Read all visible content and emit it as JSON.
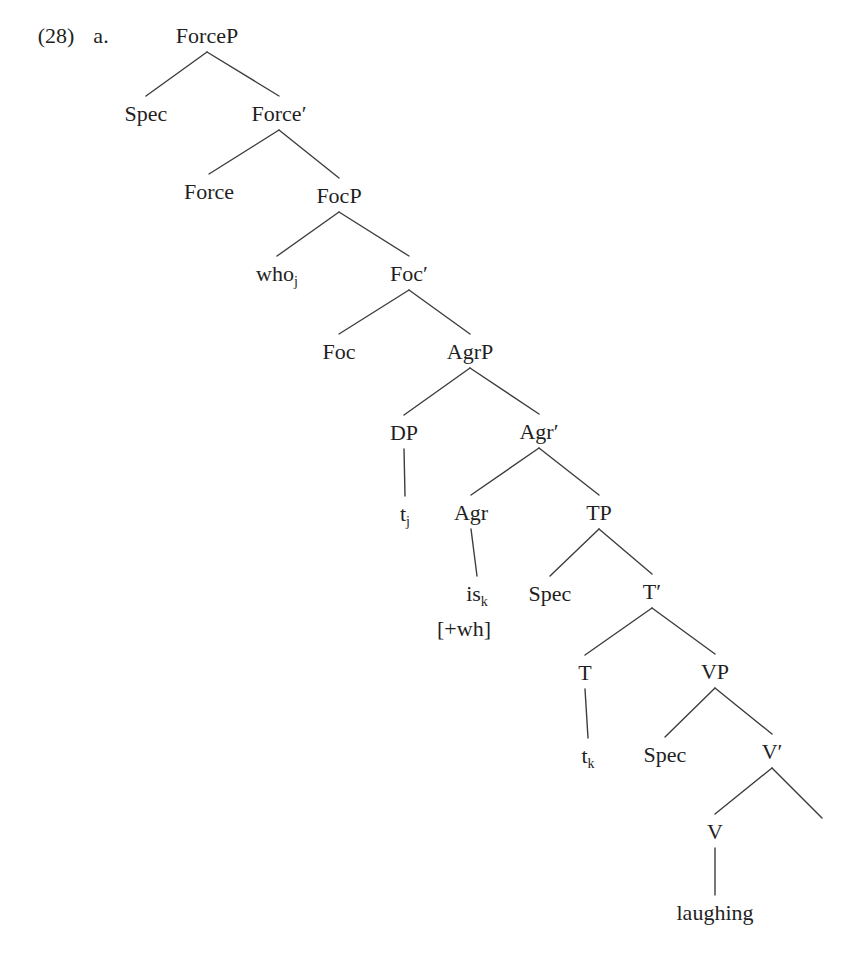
{
  "figure": {
    "example_number": "(28)",
    "example_letter": "a.",
    "text_color": "#1f1f1f",
    "line_color": "#3d3d3d"
  },
  "tree": {
    "nodes": [
      {
        "id": "forcep",
        "text": "ForceP",
        "x": 207,
        "y": 36
      },
      {
        "id": "spec-force",
        "text": "Spec",
        "x": 146,
        "y": 114
      },
      {
        "id": "force-bar",
        "text": "Force′",
        "x": 279,
        "y": 114
      },
      {
        "id": "force",
        "text": "Force",
        "x": 209,
        "y": 192
      },
      {
        "id": "focp",
        "text": "FocP",
        "x": 339,
        "y": 196
      },
      {
        "id": "who-j",
        "text": "who",
        "sub": "j",
        "x": 277,
        "y": 274
      },
      {
        "id": "foc-bar",
        "text": "Foc′",
        "x": 409,
        "y": 274
      },
      {
        "id": "foc",
        "text": "Foc",
        "x": 339,
        "y": 352
      },
      {
        "id": "agrp",
        "text": "AgrP",
        "x": 470,
        "y": 352
      },
      {
        "id": "dp",
        "text": "DP",
        "x": 404,
        "y": 433
      },
      {
        "id": "agr-bar",
        "text": "Agr′",
        "x": 539,
        "y": 432
      },
      {
        "id": "t-j",
        "text": "t",
        "sub": "j",
        "x": 405,
        "y": 514
      },
      {
        "id": "agr",
        "text": "Agr",
        "x": 471,
        "y": 513
      },
      {
        "id": "tp",
        "text": "TP",
        "x": 599,
        "y": 513
      },
      {
        "id": "is-k",
        "text": "is",
        "sub": "k",
        "x": 477,
        "y": 594
      },
      {
        "id": "spec-t",
        "text": "Spec",
        "x": 550,
        "y": 594
      },
      {
        "id": "t-bar",
        "text": "T′",
        "x": 652,
        "y": 592
      },
      {
        "id": "wh-feature",
        "text": "[+wh]",
        "x": 464,
        "y": 629
      },
      {
        "id": "t",
        "text": "T",
        "x": 585,
        "y": 673
      },
      {
        "id": "vp",
        "text": "VP",
        "x": 715,
        "y": 672
      },
      {
        "id": "t-k",
        "text": "t",
        "sub": "k",
        "x": 588,
        "y": 756
      },
      {
        "id": "spec-v",
        "text": "Spec",
        "x": 665,
        "y": 755
      },
      {
        "id": "v-bar",
        "text": "V′",
        "x": 772,
        "y": 752
      },
      {
        "id": "v",
        "text": "V",
        "x": 715,
        "y": 832
      },
      {
        "id": "laughing",
        "text": "laughing",
        "x": 715,
        "y": 913
      }
    ],
    "edges": [
      {
        "from": "forcep",
        "to": "spec-force"
      },
      {
        "from": "forcep",
        "to": "force-bar"
      },
      {
        "from": "force-bar",
        "to": "force"
      },
      {
        "from": "force-bar",
        "to": "focp"
      },
      {
        "from": "focp",
        "to": "who-j"
      },
      {
        "from": "focp",
        "to": "foc-bar"
      },
      {
        "from": "foc-bar",
        "to": "foc"
      },
      {
        "from": "foc-bar",
        "to": "agrp"
      },
      {
        "from": "agrp",
        "to": "dp"
      },
      {
        "from": "agrp",
        "to": "agr-bar"
      },
      {
        "from": "dp",
        "to": "t-j"
      },
      {
        "from": "agr-bar",
        "to": "agr"
      },
      {
        "from": "agr-bar",
        "to": "tp"
      },
      {
        "from": "agr",
        "to": "is-k"
      },
      {
        "from": "tp",
        "to": "spec-t"
      },
      {
        "from": "tp",
        "to": "t-bar"
      },
      {
        "from": "t-bar",
        "to": "t"
      },
      {
        "from": "t-bar",
        "to": "vp"
      },
      {
        "from": "t",
        "to": "t-k"
      },
      {
        "from": "vp",
        "to": "spec-v"
      },
      {
        "from": "vp",
        "to": "v-bar"
      },
      {
        "from": "v-bar",
        "to": "v"
      },
      {
        "from": "v-bar",
        "to_point": [
          822,
          818
        ]
      },
      {
        "from": "v",
        "to": "laughing"
      }
    ]
  }
}
